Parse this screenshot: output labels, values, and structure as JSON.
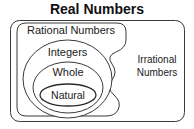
{
  "diagram": {
    "type": "venn",
    "title": "Real Numbers",
    "background_color": "#ffffff",
    "stroke_color": "#333333",
    "text_color": "#1a1a1a",
    "sets": {
      "title_label": "Real Numbers",
      "rational_label": "Rational Numbers",
      "integers_label": "Integers",
      "whole_label": "Whole",
      "natural_label": "Natural",
      "irrational_line1": "Irrational",
      "irrational_line2": "Numbers"
    }
  }
}
